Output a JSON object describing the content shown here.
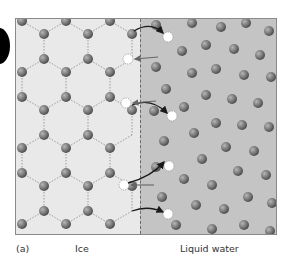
{
  "figure": {
    "panel_label": "(a)",
    "left_label": "Ice",
    "right_label": "Liquid water",
    "colors": {
      "ice_bg": "#e9e9e9",
      "liquid_bg": "#c4c4c4",
      "molecule": "#7d7d7d",
      "hydrogen_bond": "#9a9a9a",
      "arrow": "#1a1a1a",
      "released_molecule": "#ffffff"
    }
  }
}
